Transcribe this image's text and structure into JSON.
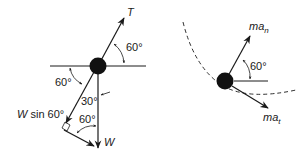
{
  "diagram": {
    "type": "free-body diagram",
    "left_figure": {
      "name": "forces on ball",
      "labels": {
        "tension": "T",
        "tension_angle": "60°",
        "weight": "W",
        "weight_component": "W sin 60°",
        "weight_component_var": "W",
        "weight_component_rest": " sin 60°",
        "angle_left": "60°",
        "angle_30": "30°",
        "angle_bottom": "60°"
      }
    },
    "right_figure": {
      "name": "inertial force components",
      "labels": {
        "normal_base": "ma",
        "normal_sub": "n",
        "tangential_base": "ma",
        "tangential_sub": "t",
        "angle": "60°"
      }
    },
    "colors": {
      "ink": "#1a1a1a",
      "background": "#ffffff"
    }
  }
}
